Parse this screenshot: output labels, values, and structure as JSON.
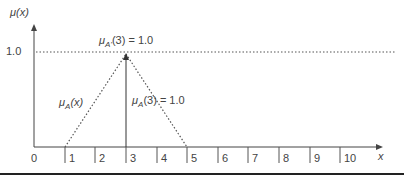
{
  "diagram": {
    "type": "fuzzy-membership-triangle",
    "y_axis_label_mu": "μ",
    "y_axis_label_arg": "(x)",
    "x_axis_label": "x",
    "y_tick_label": "1.0",
    "x_ticks": [
      "0",
      "1",
      "2",
      "3",
      "4",
      "5",
      "6",
      "7",
      "8",
      "9",
      "10"
    ],
    "top_annotation": {
      "mu": "μ",
      "sub": "A'",
      "rest": "(3) = 1.0"
    },
    "side_annotation": {
      "mu": "μ",
      "sub": "A",
      "rest": "(3) = 1.0"
    },
    "left_annotation": {
      "mu": "μ",
      "sub": "A",
      "rest": "(x)"
    },
    "triangle": {
      "left": 1,
      "peak": 3,
      "right": 5,
      "peak_value": 1.0
    },
    "singleton": {
      "x": 3,
      "value": 1.0
    },
    "colors": {
      "line": "#333333",
      "text": "#444444"
    }
  }
}
